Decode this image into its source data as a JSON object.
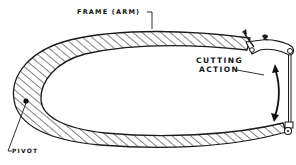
{
  "diagram": {
    "labels": {
      "frame": "FRAME (ARM)",
      "cutting_line1": "CUTTING",
      "cutting_line2": "ACTION",
      "pivot": "PIVOT"
    },
    "parts": [
      {
        "name": "frame-arm",
        "description": "hatched C-shaped frame"
      },
      {
        "name": "pivot",
        "description": "pivot point on left end of frame"
      },
      {
        "name": "blade",
        "description": "vertical blade between frame tips on right"
      },
      {
        "name": "wing-nut-clamp",
        "description": "tensioning clamp at top right"
      },
      {
        "name": "cutting-action-arrow",
        "description": "curved double-headed arrow"
      }
    ],
    "colors": {
      "line": "#1a1a1a",
      "background": "#ffffff"
    }
  }
}
